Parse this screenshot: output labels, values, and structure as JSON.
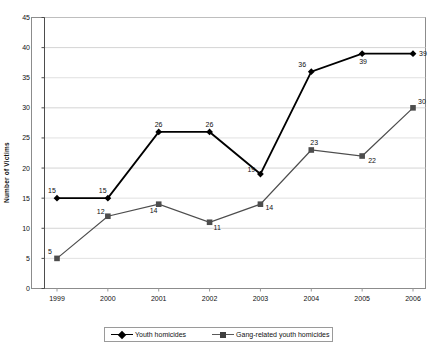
{
  "chart_data": {
    "type": "line",
    "title": "",
    "xlabel": "",
    "ylabel": "Number of Victims",
    "categories": [
      "1999",
      "2000",
      "2001",
      "2002",
      "2003",
      "2004",
      "2005",
      "2006"
    ],
    "ylim": [
      0,
      45
    ],
    "ytick_step": 5,
    "yticks": [
      "45",
      "40",
      "35",
      "30",
      "25",
      "20",
      "15",
      "10",
      "5",
      "0"
    ],
    "grid": true,
    "legend_position": "bottom",
    "series": [
      {
        "name": "Youth homicides",
        "marker": "diamond",
        "color": "#000000",
        "values": [
          15,
          15,
          26,
          26,
          19,
          36,
          39,
          39
        ],
        "labels": [
          "15",
          "15",
          "26",
          "26",
          "19",
          "36",
          "39",
          "39"
        ]
      },
      {
        "name": "Gang-related youth homicides",
        "marker": "square",
        "color": "#4d4d4d",
        "values": [
          5,
          12,
          14,
          11,
          14,
          23,
          22,
          30
        ],
        "labels": [
          "5",
          "12",
          "14",
          "11",
          "14",
          "23",
          "22",
          "30"
        ]
      }
    ]
  },
  "legend": {
    "items": [
      {
        "label": "Youth homicides"
      },
      {
        "label": "Gang-related youth homicides"
      }
    ]
  }
}
